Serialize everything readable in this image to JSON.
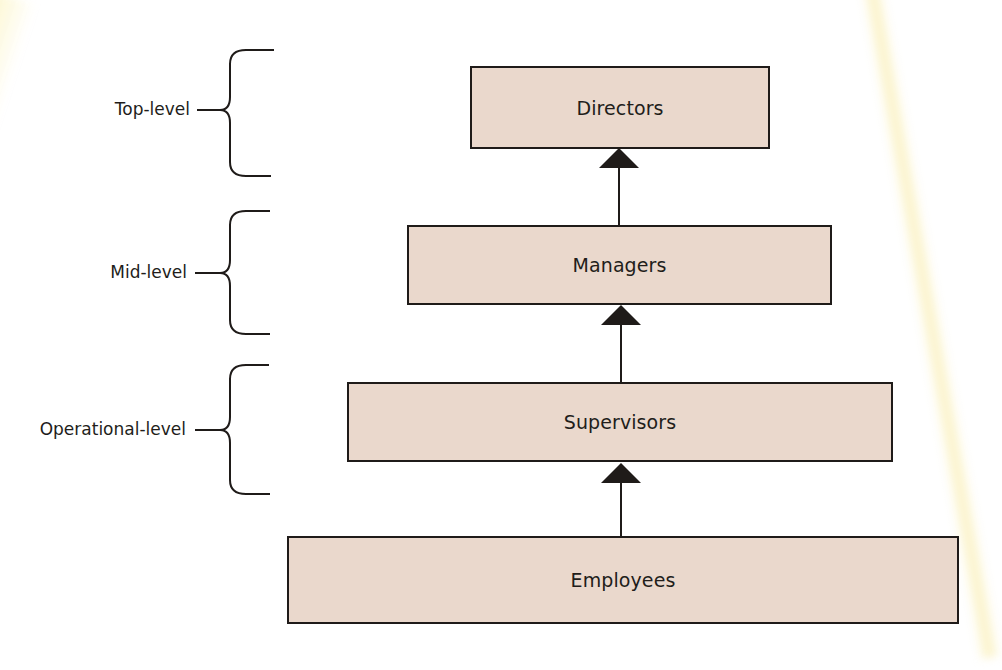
{
  "diagram": {
    "type": "hierarchy",
    "direction": "bottom-to-top",
    "colors": {
      "box_fill": "#ead8cc",
      "box_border": "#1f1b19",
      "line": "#1f1b19",
      "arrowhead": "#1f1b19",
      "background": "#ffffff"
    },
    "nodes": [
      {
        "id": "directors",
        "label": "Directors"
      },
      {
        "id": "managers",
        "label": "Managers"
      },
      {
        "id": "supervisors",
        "label": "Supervisors"
      },
      {
        "id": "employees",
        "label": "Employees"
      }
    ],
    "edges": [
      {
        "from": "employees",
        "to": "supervisors",
        "style": "arrow-up"
      },
      {
        "from": "supervisors",
        "to": "managers",
        "style": "arrow-up"
      },
      {
        "from": "managers",
        "to": "directors",
        "style": "arrow-up"
      }
    ],
    "levels": [
      {
        "label": "Top-level",
        "bracket_icon": "curly-brace-icon"
      },
      {
        "label": "Mid-level",
        "bracket_icon": "curly-brace-icon"
      },
      {
        "label": "Operational-level",
        "bracket_icon": "curly-brace-icon"
      }
    ]
  }
}
